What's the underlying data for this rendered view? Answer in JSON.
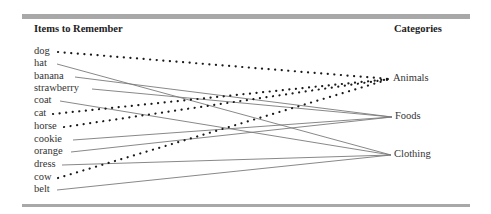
{
  "headers": {
    "left": "Items to Remember",
    "right": "Categories"
  },
  "items": [
    {
      "label": "dog",
      "y": 52,
      "category": "Animals",
      "x_start": 58
    },
    {
      "label": "hat",
      "y": 64,
      "category": "Clothing",
      "x_start": 57
    },
    {
      "label": "banana",
      "y": 77,
      "category": "Foods",
      "x_start": 75
    },
    {
      "label": "strawberry",
      "y": 89,
      "category": "Foods",
      "x_start": 92
    },
    {
      "label": "coat",
      "y": 101,
      "category": "Clothing",
      "x_start": 60
    },
    {
      "label": "cat",
      "y": 114,
      "category": "Animals",
      "x_start": 53
    },
    {
      "label": "horse",
      "y": 127,
      "category": "Animals",
      "x_start": 64
    },
    {
      "label": "cookie",
      "y": 140,
      "category": "Foods",
      "x_start": 73
    },
    {
      "label": "orange",
      "y": 152,
      "category": "Foods",
      "x_start": 71
    },
    {
      "label": "dress",
      "y": 165,
      "category": "Clothing",
      "x_start": 62
    },
    {
      "label": "cow",
      "y": 178,
      "category": "Animals",
      "x_start": 58
    },
    {
      "label": "belt",
      "y": 190,
      "category": "Clothing",
      "x_start": 57
    }
  ],
  "categories": [
    {
      "label": "Animals",
      "y": 79,
      "x_join": 390,
      "style": "dotted"
    },
    {
      "label": "Foods",
      "y": 117,
      "x_join": 392,
      "style": "solid"
    },
    {
      "label": "Clothing",
      "y": 155,
      "x_join": 391,
      "style": "solid"
    }
  ],
  "colors": {
    "dotted_line": "#1a1a1a",
    "solid_line": "#7a7a7a",
    "rule": "#a8a8a8"
  }
}
